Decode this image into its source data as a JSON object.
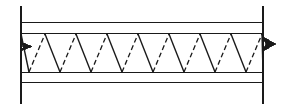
{
  "drawing": {
    "title": "Open-Web Steel Joist Elevation",
    "description": "Side elevation of an open web steel bar joist showing top chord, bottom chord and zigzag web members with break lines at each end",
    "canvas": {
      "width": 282,
      "height": 110,
      "background": "#ffffff"
    },
    "stroke_color": "#1a1a1a",
    "line_weight_thin": 1,
    "line_weight_medium": 1.3
  },
  "top_chord": {
    "label": "Top chord",
    "lines": [
      {
        "name": "top-chord-outer",
        "y": 22.5,
        "x1": 21,
        "x2": 263,
        "style": "solid"
      },
      {
        "name": "top-chord-inner",
        "y": 33.5,
        "x1": 21,
        "x2": 263,
        "style": "solid"
      }
    ]
  },
  "bottom_chord": {
    "label": "Bottom chord",
    "lines": [
      {
        "name": "bottom-chord-inner",
        "y": 72.5,
        "x1": 21,
        "x2": 263,
        "style": "solid"
      },
      {
        "name": "bottom-chord-outer",
        "y": 82.5,
        "x1": 21,
        "x2": 263,
        "style": "solid"
      }
    ]
  },
  "web": {
    "label": "Web members",
    "panel_count": 8,
    "peak_y": 34,
    "valley_y": 72,
    "x_start": 21,
    "x_end": 263,
    "peaks_x": [
      45,
      76,
      107,
      138,
      169,
      200,
      231,
      262
    ],
    "valleys_x": [
      29,
      60,
      91,
      122,
      153,
      184,
      215,
      246
    ],
    "solid_members_note": "Near-side web angles drawn solid, descending left to right",
    "dashed_members_note": "Far-side web angles drawn dashed, ascending left to right",
    "dash_pattern": "5 3"
  },
  "break_symbols": [
    {
      "name": "left-break",
      "vertical_x": 21,
      "y_top": 6,
      "y_bottom": 104,
      "arrow_y": 46,
      "arrow_direction": "right"
    },
    {
      "name": "right-break",
      "vertical_x": 263,
      "y_top": 6,
      "y_bottom": 104,
      "arrow_y": 44,
      "arrow_direction": "left"
    }
  ]
}
